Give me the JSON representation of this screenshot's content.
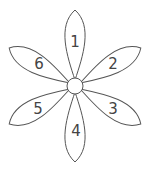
{
  "diagram": {
    "type": "flower",
    "center": {
      "x": 75,
      "y": 86,
      "r": 8
    },
    "stroke_color": "#555555",
    "petals": [
      {
        "label": "1",
        "angle": -90
      },
      {
        "label": "2",
        "angle": -30
      },
      {
        "label": "3",
        "angle": 30
      },
      {
        "label": "4",
        "angle": 90
      },
      {
        "label": "5",
        "angle": 150
      },
      {
        "label": "6",
        "angle": 210
      }
    ]
  }
}
